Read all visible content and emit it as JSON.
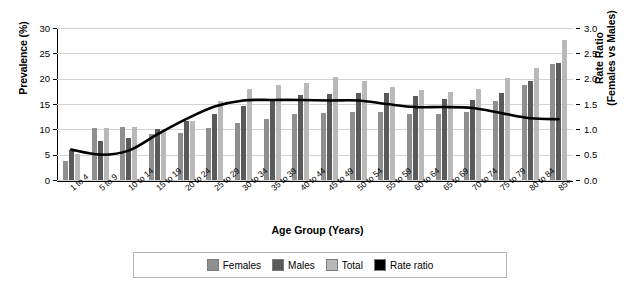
{
  "chart_data": {
    "type": "bar",
    "title": "",
    "xlabel": "Age Group (Years)",
    "ylabel": "Prevalence (%)",
    "ylabel_right_line1": "Rate Ratio",
    "ylabel_right_line2": "(Females vs Males)",
    "ylim": [
      0,
      30
    ],
    "ylim_right": [
      0,
      3.0
    ],
    "yticks": [
      "0",
      "5",
      "10",
      "15",
      "20",
      "25",
      "30"
    ],
    "ytick_values": [
      0,
      5,
      10,
      15,
      20,
      25,
      30
    ],
    "yticks_right": [
      "0.0",
      "0.5",
      "1.0",
      "1.5",
      "2.0",
      "2.5",
      "3.0"
    ],
    "ytick_values_right": [
      0.0,
      0.5,
      1.0,
      1.5,
      2.0,
      2.5,
      3.0
    ],
    "grid": true,
    "legend_position": "bottom",
    "categories": [
      "1 to 4",
      "5 to 9",
      "10 to 14",
      "15 to 19",
      "20 to 24",
      "25 to 29",
      "30 to 34",
      "35 to 39",
      "40 to 44",
      "45 to 49",
      "50 to 54",
      "55 to 59",
      "60 to 64",
      "65 to 69",
      "70 to 74",
      "75 to 79",
      "80 to 84",
      "85+"
    ],
    "series": [
      {
        "name": "Females",
        "type": "bar",
        "color": "#8f8f8f",
        "axis": "left",
        "values": [
          3.8,
          10.3,
          10.5,
          9.0,
          9.3,
          10.2,
          11.3,
          12.0,
          13.0,
          13.3,
          13.4,
          13.4,
          13.0,
          13.1,
          13.4,
          15.6,
          18.8,
          22.8
        ]
      },
      {
        "name": "Males",
        "type": "bar",
        "color": "#5a5a5a",
        "axis": "left",
        "values": [
          5.9,
          7.7,
          8.2,
          10.1,
          11.7,
          13.1,
          14.7,
          15.8,
          16.8,
          17.0,
          17.2,
          17.1,
          16.5,
          16.0,
          15.8,
          17.2,
          19.6,
          23.0
        ]
      },
      {
        "name": "Total",
        "type": "bar",
        "color": "#b9b9b9",
        "axis": "left",
        "values": [
          5.2,
          10.3,
          10.5,
          10.1,
          11.7,
          15.6,
          17.9,
          18.8,
          19.1,
          20.4,
          19.6,
          18.3,
          17.8,
          17.3,
          18.0,
          20.2,
          22.2,
          27.6
        ]
      },
      {
        "name": "Rate ratio",
        "type": "line",
        "color": "#000000",
        "axis": "right",
        "values": [
          0.6,
          0.5,
          0.58,
          0.9,
          1.2,
          1.45,
          1.57,
          1.58,
          1.58,
          1.57,
          1.57,
          1.5,
          1.44,
          1.44,
          1.42,
          1.32,
          1.22,
          1.2
        ]
      }
    ],
    "legend": [
      {
        "label": "Females",
        "color": "#8f8f8f"
      },
      {
        "label": "Males",
        "color": "#5a5a5a"
      },
      {
        "label": "Total",
        "color": "#b9b9b9"
      },
      {
        "label": "Rate ratio",
        "color": "#000000"
      }
    ]
  }
}
